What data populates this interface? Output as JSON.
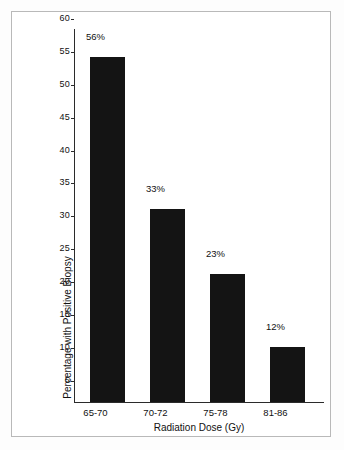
{
  "chart_data": {
    "type": "bar",
    "title": "",
    "subtitle": "",
    "xlabel": "Radiation Dose (Gy)",
    "ylabel": "Percentage with Positive Biopsy",
    "categories": [
      "65-70",
      "70-72",
      "75-78",
      "81-86"
    ],
    "values": [
      56,
      33,
      23,
      12
    ],
    "value_labels": [
      "56%",
      "33%",
      "23%",
      "12%"
    ],
    "ylim": [
      0,
      60
    ],
    "yticks": [
      60,
      55,
      50,
      45,
      40,
      35,
      30,
      25,
      20,
      15,
      10,
      5
    ],
    "ytick_labels": [
      "60",
      "55",
      "50",
      "45",
      "40",
      "35",
      "30",
      "25",
      "20",
      "15",
      "10",
      "5"
    ],
    "grid": false,
    "legend": null,
    "bar_color": "#141414",
    "axis_color": "#2b2b2b",
    "background_color": "#ffffff",
    "frame_color": "#b9b9b9"
  }
}
